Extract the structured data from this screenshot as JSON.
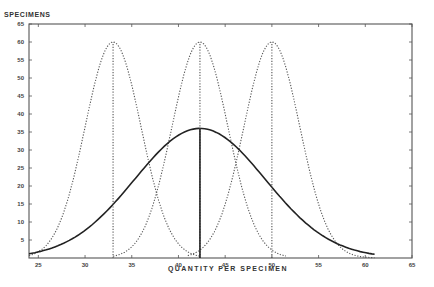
{
  "chart_data": {
    "type": "line",
    "title": "",
    "xlabel": "QUANTITY PER SPECIMEN",
    "ylabel": "SPECIMENS",
    "xlim": [
      24,
      65
    ],
    "ylim": [
      0,
      65
    ],
    "x_ticks": [
      25,
      30,
      35,
      40,
      45,
      50,
      55,
      60,
      65
    ],
    "y_ticks": [
      5,
      10,
      15,
      20,
      25,
      30,
      35,
      40,
      45,
      50,
      55,
      60,
      65
    ],
    "grid": false,
    "legend": null,
    "series": [
      {
        "name": "Sample distribution A",
        "style": "dotted",
        "mean": 33,
        "peak": 60,
        "x_range": [
          24,
          42.3
        ],
        "sd": 3.0
      },
      {
        "name": "Sample distribution B",
        "style": "dotted",
        "mean": 42.3,
        "peak": 60,
        "x_range": [
          33,
          51.5
        ],
        "sd": 3.0
      },
      {
        "name": "Sample distribution C",
        "style": "dotted",
        "mean": 50,
        "peak": 60,
        "x_range": [
          41,
          61
        ],
        "sd": 3.0
      },
      {
        "name": "Combined population",
        "style": "solid",
        "mean": 42.3,
        "peak": 36,
        "x_range": [
          24,
          61
        ],
        "sd": 7.0
      }
    ],
    "mean_lines": [
      {
        "x": 33,
        "height": 60,
        "style": "dotted"
      },
      {
        "x": 42.3,
        "height": 60,
        "style": "dotted"
      },
      {
        "x": 50,
        "height": 60,
        "style": "dotted"
      },
      {
        "x": 42.3,
        "height": 36,
        "style": "solid"
      }
    ]
  }
}
